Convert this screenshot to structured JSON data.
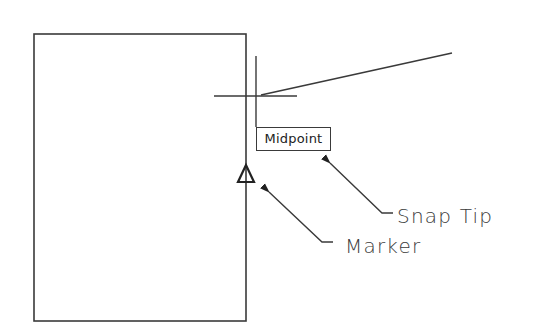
{
  "diagram": {
    "snap_tip_text": "Midpoint",
    "callouts": [
      {
        "label": "Snap Tip",
        "target": "snap-tip-tooltip"
      },
      {
        "label": "Marker",
        "target": "midpoint-marker"
      }
    ],
    "colors": {
      "background": "#ffffff",
      "line": "#3a3a3a",
      "text": "#222222"
    },
    "shapes": {
      "rectangle": {
        "x1": 34,
        "y1": 34,
        "x2": 246,
        "y2": 321
      },
      "snap_vertical_line": {
        "x": 256,
        "y1": 56,
        "y2": 127
      },
      "crosshair": {
        "cx": 256,
        "cy": 96,
        "x1": 214,
        "x2": 297
      },
      "angled_line": {
        "x1": 261,
        "y1": 95,
        "x2": 452,
        "y2": 53
      },
      "marker_triangle": {
        "apex": [
          246,
          165
        ],
        "base_left": [
          238,
          182
        ],
        "base_right": [
          254,
          182
        ]
      }
    }
  }
}
